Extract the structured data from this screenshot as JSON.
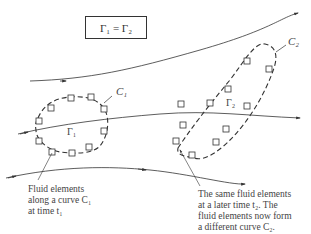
{
  "equation_box": {
    "text": "Γ₁ = Γ₂"
  },
  "labels": {
    "c1": "C₁",
    "c2": "C₂",
    "gamma1": "Γ₁",
    "gamma2": "Γ₂"
  },
  "annotation_left": {
    "line1": "Fluid elements",
    "line2": "along a curve C₁",
    "line3": "at time t₁"
  },
  "annotation_right": {
    "line1": "The same fluid elements",
    "line2": "at a later time t₂.  The",
    "line3": "fluid elements now form",
    "line4": "a different curve C₂."
  },
  "colors": {
    "stroke": "#333333",
    "background": "#ffffff"
  }
}
